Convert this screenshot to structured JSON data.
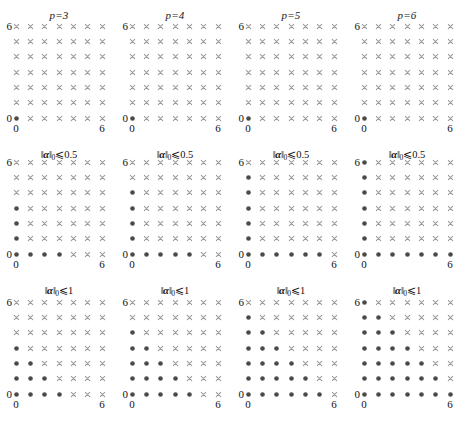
{
  "figure": {
    "type": "scatter-grid",
    "rows": 3,
    "cols": 4,
    "marker_filled_color": "#4a4a4a",
    "marker_cross_color": "#9a9a9a"
  },
  "axes": {
    "x_min_label": "0",
    "x_max_label": "6",
    "y_min_label": "0",
    "y_max_label": "6",
    "x_min": 0,
    "x_max": 6,
    "y_min": 0,
    "y_max": 6,
    "grid_points": 7
  },
  "column_titles": [
    {
      "label": "p=3",
      "p": 3
    },
    {
      "label": "p=4",
      "p": 4
    },
    {
      "label": "p=5",
      "p": 5
    },
    {
      "label": "p=6",
      "p": 6
    }
  ],
  "row_captions": [
    {
      "q": 0.5,
      "bars": "‖",
      "alpha": "α",
      "sub": "0",
      "rel": "⩽",
      "value": "0.5"
    },
    {
      "q": 1,
      "bars": "‖",
      "alpha": "α",
      "sub": "0",
      "rel": "⩽",
      "value": "1"
    },
    {
      "q": 2,
      "bars": "‖",
      "alpha": "α",
      "sub": "0",
      "rel": "⩽",
      "value": "2"
    }
  ],
  "chart_data": {
    "type": "scatter",
    "title": "",
    "xlabel": "",
    "ylabel": "",
    "xlim": [
      0,
      6
    ],
    "ylim": [
      0,
      6
    ],
    "grid": false,
    "legend": "none",
    "marker_types": {
      "included": "filled-dot",
      "excluded": "cross"
    },
    "panels": [
      {
        "p": 3,
        "q": 0.5,
        "caption": "||alpha||_0 <= 0.5",
        "row": 0,
        "col": 0,
        "included": [
          [
            0,
            0
          ]
        ]
      },
      {
        "p": 4,
        "q": 0.5,
        "caption": "||alpha||_0 <= 0.5",
        "row": 0,
        "col": 1,
        "included": [
          [
            0,
            0
          ]
        ]
      },
      {
        "p": 5,
        "q": 0.5,
        "caption": "||alpha||_0 <= 0.5",
        "row": 0,
        "col": 2,
        "included": [
          [
            0,
            0
          ]
        ]
      },
      {
        "p": 6,
        "q": 0.5,
        "caption": "||alpha||_0 <= 0.5",
        "row": 0,
        "col": 3,
        "included": [
          [
            0,
            0
          ]
        ]
      },
      {
        "p": 3,
        "q": 1,
        "caption": "||alpha||_0 <= 1",
        "row": 1,
        "col": 0,
        "included": [
          [
            0,
            0
          ],
          [
            1,
            0
          ],
          [
            2,
            0
          ],
          [
            3,
            0
          ],
          [
            0,
            1
          ],
          [
            0,
            2
          ],
          [
            0,
            3
          ]
        ]
      },
      {
        "p": 4,
        "q": 1,
        "caption": "||alpha||_0 <= 1",
        "row": 1,
        "col": 1,
        "included": [
          [
            0,
            0
          ],
          [
            1,
            0
          ],
          [
            2,
            0
          ],
          [
            3,
            0
          ],
          [
            4,
            0
          ],
          [
            0,
            1
          ],
          [
            0,
            2
          ],
          [
            0,
            3
          ],
          [
            0,
            4
          ]
        ]
      },
      {
        "p": 5,
        "q": 1,
        "caption": "||alpha||_0 <= 1",
        "row": 1,
        "col": 2,
        "included": [
          [
            0,
            0
          ],
          [
            1,
            0
          ],
          [
            2,
            0
          ],
          [
            3,
            0
          ],
          [
            4,
            0
          ],
          [
            5,
            0
          ],
          [
            0,
            1
          ],
          [
            0,
            2
          ],
          [
            0,
            3
          ],
          [
            0,
            4
          ],
          [
            0,
            5
          ]
        ]
      },
      {
        "p": 6,
        "q": 1,
        "caption": "||alpha||_0 <= 1",
        "row": 1,
        "col": 3,
        "included": [
          [
            0,
            0
          ],
          [
            1,
            0
          ],
          [
            2,
            0
          ],
          [
            3,
            0
          ],
          [
            4,
            0
          ],
          [
            5,
            0
          ],
          [
            6,
            0
          ],
          [
            0,
            1
          ],
          [
            0,
            2
          ],
          [
            0,
            3
          ],
          [
            0,
            4
          ],
          [
            0,
            5
          ],
          [
            0,
            6
          ]
        ]
      },
      {
        "p": 3,
        "q": 2,
        "caption": "||alpha||_0 <= 2",
        "row": 2,
        "col": 0,
        "included": [
          [
            0,
            0
          ],
          [
            1,
            0
          ],
          [
            2,
            0
          ],
          [
            3,
            0
          ],
          [
            0,
            1
          ],
          [
            1,
            1
          ],
          [
            2,
            1
          ],
          [
            0,
            2
          ],
          [
            1,
            2
          ],
          [
            0,
            3
          ]
        ]
      },
      {
        "p": 4,
        "q": 2,
        "caption": "||alpha||_0 <= 2",
        "row": 2,
        "col": 1,
        "included": [
          [
            0,
            0
          ],
          [
            1,
            0
          ],
          [
            2,
            0
          ],
          [
            3,
            0
          ],
          [
            4,
            0
          ],
          [
            0,
            1
          ],
          [
            1,
            1
          ],
          [
            2,
            1
          ],
          [
            3,
            1
          ],
          [
            0,
            2
          ],
          [
            1,
            2
          ],
          [
            2,
            2
          ],
          [
            0,
            3
          ],
          [
            1,
            3
          ],
          [
            0,
            4
          ]
        ]
      },
      {
        "p": 5,
        "q": 2,
        "caption": "||alpha||_0 <= 2",
        "row": 2,
        "col": 2,
        "included": [
          [
            0,
            0
          ],
          [
            1,
            0
          ],
          [
            2,
            0
          ],
          [
            3,
            0
          ],
          [
            4,
            0
          ],
          [
            5,
            0
          ],
          [
            0,
            1
          ],
          [
            1,
            1
          ],
          [
            2,
            1
          ],
          [
            3,
            1
          ],
          [
            4,
            1
          ],
          [
            0,
            2
          ],
          [
            1,
            2
          ],
          [
            2,
            2
          ],
          [
            3,
            2
          ],
          [
            0,
            3
          ],
          [
            1,
            3
          ],
          [
            2,
            3
          ],
          [
            0,
            4
          ],
          [
            1,
            4
          ],
          [
            0,
            5
          ]
        ]
      },
      {
        "p": 6,
        "q": 2,
        "caption": "||alpha||_0 <= 2",
        "row": 2,
        "col": 3,
        "included": [
          [
            0,
            0
          ],
          [
            1,
            0
          ],
          [
            2,
            0
          ],
          [
            3,
            0
          ],
          [
            4,
            0
          ],
          [
            5,
            0
          ],
          [
            6,
            0
          ],
          [
            0,
            1
          ],
          [
            1,
            1
          ],
          [
            2,
            1
          ],
          [
            3,
            1
          ],
          [
            4,
            1
          ],
          [
            5,
            1
          ],
          [
            0,
            2
          ],
          [
            1,
            2
          ],
          [
            2,
            2
          ],
          [
            3,
            2
          ],
          [
            4,
            2
          ],
          [
            0,
            3
          ],
          [
            1,
            3
          ],
          [
            2,
            3
          ],
          [
            3,
            3
          ],
          [
            0,
            4
          ],
          [
            1,
            4
          ],
          [
            2,
            4
          ],
          [
            0,
            5
          ],
          [
            1,
            5
          ],
          [
            0,
            6
          ]
        ]
      }
    ]
  }
}
